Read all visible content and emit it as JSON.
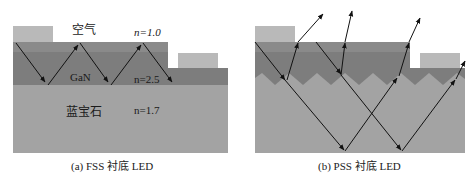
{
  "panel_a": {
    "caption": "(a) FSS 衬底 LED",
    "labels": {
      "air": "空气",
      "n_air": "n=1.0",
      "gan": "GaN",
      "n_gan": "n=2.5",
      "sapphire": "蓝宝石",
      "n_sapphire": "n=1.7"
    }
  },
  "panel_b": {
    "caption": "(b) PSS 衬底 LED"
  },
  "colors": {
    "contact": "#b9b9b9",
    "gan_top": "#8c8c8c",
    "gan": "#7d7d7d",
    "sapphire": "#a3a3a3",
    "arrow": "#111111"
  }
}
